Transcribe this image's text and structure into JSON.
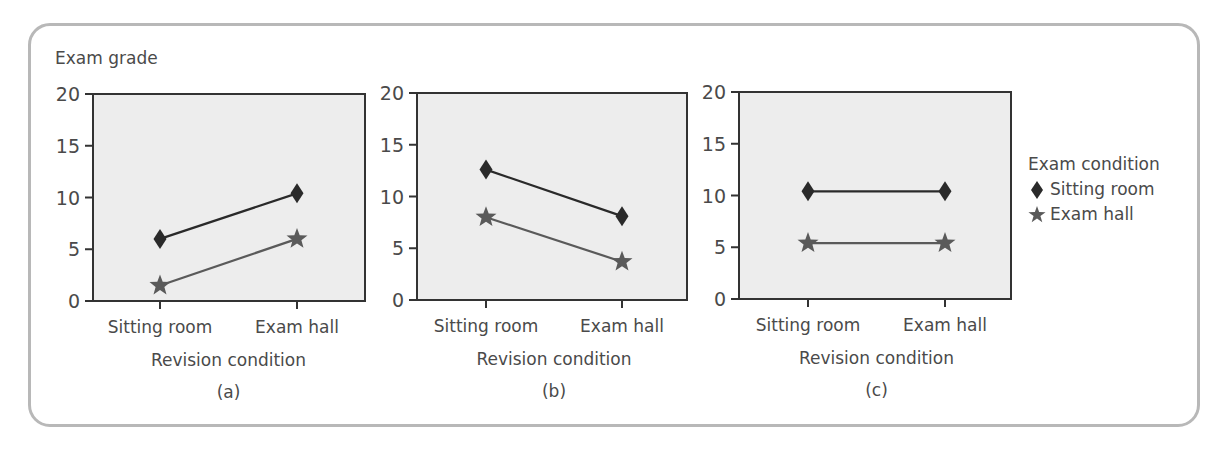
{
  "figure": {
    "y_axis_title": "Exam grade",
    "legend": {
      "title": "Exam condition",
      "items": [
        {
          "label": "Sitting room",
          "marker": "diamond-icon",
          "color": "#2a2a2a"
        },
        {
          "label": "Exam hall",
          "marker": "star-icon",
          "color": "#5a5a5a"
        }
      ]
    },
    "colors": {
      "plot_background": "#ededed",
      "axis": "#333333",
      "frame_border": "#b8b8b8",
      "text": "#4a4a4a"
    },
    "panels": [
      {
        "caption": "(a)",
        "xlabel": "Revision condition",
        "categories": [
          "Sitting room",
          "Exam hall"
        ],
        "yticks": [
          "0",
          "5",
          "10",
          "15",
          "20"
        ]
      },
      {
        "caption": "(b)",
        "xlabel": "Revision condition",
        "categories": [
          "Sitting room",
          "Exam hall"
        ],
        "yticks": [
          "0",
          "5",
          "10",
          "15",
          "20"
        ]
      },
      {
        "caption": "(c)",
        "xlabel": "Revision condition",
        "categories": [
          "Sitting room",
          "Exam hall"
        ],
        "yticks": [
          "0",
          "5",
          "10",
          "15",
          "20"
        ]
      }
    ]
  },
  "chart_data": [
    {
      "type": "line",
      "title": "(a)",
      "xlabel": "Revision condition",
      "ylabel": "Exam grade",
      "categories": [
        "Sitting room",
        "Exam hall"
      ],
      "series": [
        {
          "name": "Sitting room",
          "marker": "diamond",
          "values": [
            6,
            10.4
          ]
        },
        {
          "name": "Exam hall",
          "marker": "star",
          "values": [
            1.5,
            6
          ]
        }
      ],
      "ylim": [
        0,
        20
      ],
      "yticks": [
        0,
        5,
        10,
        15,
        20
      ],
      "grid": false,
      "legend_title": "Exam condition",
      "legend_position": "right"
    },
    {
      "type": "line",
      "title": "(b)",
      "xlabel": "Revision condition",
      "ylabel": "",
      "categories": [
        "Sitting room",
        "Exam hall"
      ],
      "series": [
        {
          "name": "Sitting room",
          "marker": "diamond",
          "values": [
            12.6,
            8.1
          ]
        },
        {
          "name": "Exam hall",
          "marker": "star",
          "values": [
            8,
            3.7
          ]
        }
      ],
      "ylim": [
        0,
        20
      ],
      "yticks": [
        0,
        5,
        10,
        15,
        20
      ],
      "grid": false
    },
    {
      "type": "line",
      "title": "(c)",
      "xlabel": "Revision condition",
      "ylabel": "",
      "categories": [
        "Sitting room",
        "Exam hall"
      ],
      "series": [
        {
          "name": "Sitting room",
          "marker": "diamond",
          "values": [
            10.4,
            10.4
          ]
        },
        {
          "name": "Exam hall",
          "marker": "star",
          "values": [
            5.4,
            5.4
          ]
        }
      ],
      "ylim": [
        0,
        20
      ],
      "yticks": [
        0,
        5,
        10,
        15,
        20
      ],
      "grid": false
    }
  ]
}
